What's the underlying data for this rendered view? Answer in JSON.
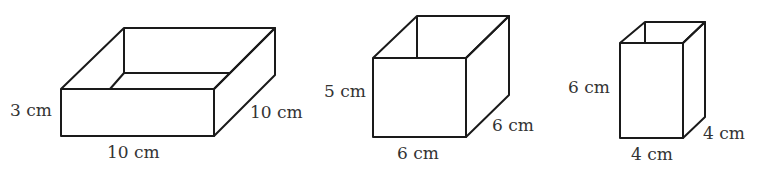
{
  "diagram": {
    "boxes": [
      {
        "id": "box-1",
        "description": "open-top box, wide and shallow",
        "fill": "#e4e6e8",
        "height_label": "3 cm",
        "width_label": "10 cm",
        "depth_label": "10 cm",
        "height_cm": 3,
        "width_cm": 10,
        "depth_cm": 10
      },
      {
        "id": "box-2",
        "description": "open-top box, cube-like",
        "fill": "#bdbfc1",
        "height_label": "5 cm",
        "width_label": "6 cm",
        "depth_label": "6 cm",
        "height_cm": 5,
        "width_cm": 6,
        "depth_cm": 6
      },
      {
        "id": "box-3",
        "description": "open-top box, tall and narrow",
        "fill": "#f3cdc9",
        "height_label": "6 cm",
        "width_label": "4 cm",
        "depth_label": "4 cm",
        "height_cm": 6,
        "width_cm": 4,
        "depth_cm": 4
      }
    ]
  }
}
